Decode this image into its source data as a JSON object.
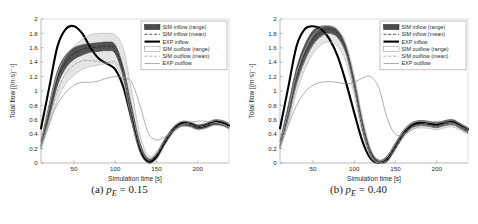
{
  "figure": {
    "panels": [
      {
        "caption_tag": "(a)",
        "caption_var": "p",
        "caption_sub": "E",
        "caption_eq": "= 0.15",
        "caption_full": "(a) p_E = 0.15"
      },
      {
        "caption_tag": "(b)",
        "caption_var": "p",
        "caption_sub": "E",
        "caption_eq": "= 0.40",
        "caption_full": "(b) p_E = 0.40"
      }
    ]
  },
  "chart_data": [
    {
      "type": "line",
      "title": "",
      "xlabel": "Simulation time [s]",
      "ylabel": "Total flow [(m·s)⁻¹]",
      "xlim": [
        10,
        238
      ],
      "ylim": [
        0,
        2
      ],
      "xticks": [
        50,
        100,
        150,
        200
      ],
      "yticks": [
        0,
        0.2,
        0.4,
        0.6,
        0.8,
        1,
        1.2,
        1.4,
        1.6,
        1.8,
        2
      ],
      "ytick_labels": [
        "0",
        "0.2",
        "0.4",
        "0.6",
        "0.8",
        "1",
        "1.2",
        "1.4",
        "1.6",
        "1.8",
        "2"
      ],
      "grid": false,
      "legend_position": "top-right",
      "legend": [
        {
          "label": "SIM inflow (range)",
          "style": "band-dark",
          "color": "#3a3a3a"
        },
        {
          "label": "SIM inflow (mean)",
          "style": "dashed-dark",
          "color": "#2b2b2b"
        },
        {
          "label": "EXP inflow",
          "style": "solid-thick",
          "color": "#000000"
        },
        {
          "label": "SIM outflow (range)",
          "style": "band-light",
          "color": "#b5b5b5"
        },
        {
          "label": "SIM outflow (mean)",
          "style": "dashed-light",
          "color": "#9a9a9a"
        },
        {
          "label": "EXP outflow",
          "style": "solid-thin",
          "color": "#8c8c8c"
        }
      ],
      "x": [
        10,
        20,
        30,
        40,
        50,
        60,
        70,
        80,
        90,
        100,
        110,
        120,
        130,
        140,
        150,
        160,
        170,
        180,
        190,
        200,
        210,
        220,
        230,
        238
      ],
      "series": [
        {
          "name": "EXP inflow",
          "style": "solid-thick",
          "color": "#000000",
          "values": [
            0.48,
            1.05,
            1.62,
            1.86,
            1.9,
            1.8,
            1.6,
            1.45,
            1.38,
            1.3,
            1.05,
            0.6,
            0.18,
            0.02,
            0.08,
            0.28,
            0.45,
            0.55,
            0.55,
            0.5,
            0.52,
            0.57,
            0.56,
            0.52
          ]
        },
        {
          "name": "SIM inflow (mean)",
          "style": "dashed-dark",
          "color": "#2b2b2b",
          "values": [
            0.24,
            0.72,
            1.18,
            1.4,
            1.52,
            1.58,
            1.6,
            1.61,
            1.62,
            1.58,
            1.25,
            0.7,
            0.22,
            0.03,
            0.1,
            0.3,
            0.46,
            0.54,
            0.54,
            0.5,
            0.52,
            0.56,
            0.55,
            0.51
          ]
        },
        {
          "name": "SIM inflow (range) upper",
          "style": "band-edge-dark",
          "color": "#4a4a4a",
          "values": [
            0.3,
            0.82,
            1.28,
            1.5,
            1.6,
            1.64,
            1.66,
            1.67,
            1.68,
            1.64,
            1.32,
            0.78,
            0.28,
            0.06,
            0.13,
            0.33,
            0.49,
            0.57,
            0.57,
            0.53,
            0.55,
            0.6,
            0.59,
            0.55
          ]
        },
        {
          "name": "SIM inflow (range) lower",
          "style": "band-edge-dark",
          "color": "#4a4a4a",
          "values": [
            0.2,
            0.64,
            1.08,
            1.32,
            1.44,
            1.5,
            1.54,
            1.55,
            1.56,
            1.52,
            1.18,
            0.62,
            0.16,
            0.0,
            0.06,
            0.26,
            0.43,
            0.51,
            0.51,
            0.47,
            0.49,
            0.53,
            0.52,
            0.48
          ]
        },
        {
          "name": "EXP outflow",
          "style": "solid-thin",
          "color": "#8c8c8c",
          "values": [
            0.22,
            0.55,
            0.82,
            0.98,
            1.08,
            1.12,
            1.12,
            1.14,
            1.18,
            1.2,
            1.18,
            1.12,
            0.8,
            0.42,
            0.32,
            0.36,
            0.44,
            0.52,
            0.56,
            0.58,
            0.58,
            0.57,
            0.54,
            0.5
          ]
        },
        {
          "name": "SIM outflow (mean)",
          "style": "dashed-light",
          "color": "#9a9a9a",
          "values": [
            0.22,
            0.6,
            1.0,
            1.24,
            1.36,
            1.42,
            1.42,
            1.41,
            1.4,
            1.4,
            1.22,
            0.72,
            0.24,
            0.04,
            0.12,
            0.3,
            0.45,
            0.53,
            0.54,
            0.5,
            0.52,
            0.56,
            0.54,
            0.5
          ]
        },
        {
          "name": "SIM outflow (range) upper",
          "style": "band-edge-light",
          "color": "#b5b5b5",
          "values": [
            0.26,
            0.78,
            1.24,
            1.48,
            1.62,
            1.72,
            1.78,
            1.8,
            1.8,
            1.78,
            1.58,
            1.0,
            0.4,
            0.1,
            0.16,
            0.34,
            0.5,
            0.58,
            0.58,
            0.54,
            0.56,
            0.6,
            0.58,
            0.54
          ]
        },
        {
          "name": "SIM outflow (range) lower",
          "style": "band-edge-light",
          "color": "#b5b5b5",
          "values": [
            0.2,
            0.52,
            0.88,
            1.1,
            1.22,
            1.3,
            1.34,
            1.36,
            1.38,
            1.36,
            1.12,
            0.58,
            0.14,
            0.0,
            0.05,
            0.24,
            0.41,
            0.5,
            0.5,
            0.46,
            0.48,
            0.52,
            0.51,
            0.47
          ]
        }
      ]
    },
    {
      "type": "line",
      "title": "",
      "xlabel": "Simulation time [s]",
      "ylabel": "Total flow [(m·s)⁻¹]",
      "xlim": [
        10,
        238
      ],
      "ylim": [
        0,
        2
      ],
      "xticks": [
        50,
        100,
        150,
        200
      ],
      "yticks": [
        0,
        0.2,
        0.4,
        0.6,
        0.8,
        1,
        1.2,
        1.4,
        1.6,
        1.8,
        2
      ],
      "ytick_labels": [
        "0",
        "0.2",
        "0.4",
        "0.6",
        "0.8",
        "1",
        "1.2",
        "1.4",
        "1.6",
        "1.8",
        "2"
      ],
      "grid": false,
      "legend_position": "top-right",
      "legend": [
        {
          "label": "SIM inflow (range)",
          "style": "band-dark",
          "color": "#3a3a3a"
        },
        {
          "label": "SIM inflow (mean)",
          "style": "dashed-dark",
          "color": "#2b2b2b"
        },
        {
          "label": "EXP inflow",
          "style": "solid-thick",
          "color": "#000000"
        },
        {
          "label": "SIM outflow (range)",
          "style": "band-light",
          "color": "#b5b5b5"
        },
        {
          "label": "SIM outflow (mean)",
          "style": "dashed-light",
          "color": "#9a9a9a"
        },
        {
          "label": "EXP outflow",
          "style": "solid-thin",
          "color": "#8c8c8c"
        }
      ],
      "x": [
        10,
        20,
        30,
        40,
        50,
        60,
        70,
        80,
        90,
        100,
        110,
        120,
        130,
        140,
        150,
        160,
        170,
        180,
        190,
        200,
        210,
        220,
        230,
        238
      ],
      "series": [
        {
          "name": "EXP inflow",
          "style": "solid-thick",
          "color": "#000000",
          "values": [
            0.48,
            1.05,
            1.62,
            1.86,
            1.9,
            1.86,
            1.72,
            1.48,
            1.12,
            0.7,
            0.3,
            0.06,
            0.0,
            0.05,
            0.22,
            0.4,
            0.52,
            0.56,
            0.55,
            0.54,
            0.57,
            0.58,
            0.52,
            0.47
          ]
        },
        {
          "name": "SIM inflow (mean)",
          "style": "dashed-dark",
          "color": "#2b2b2b",
          "values": [
            0.24,
            0.7,
            1.2,
            1.52,
            1.72,
            1.82,
            1.86,
            1.8,
            1.58,
            1.1,
            0.52,
            0.14,
            0.01,
            0.06,
            0.24,
            0.42,
            0.52,
            0.55,
            0.54,
            0.52,
            0.55,
            0.56,
            0.5,
            0.45
          ]
        },
        {
          "name": "SIM inflow (range) upper",
          "style": "band-edge-dark",
          "color": "#4a4a4a",
          "values": [
            0.3,
            0.8,
            1.32,
            1.64,
            1.84,
            1.9,
            1.9,
            1.84,
            1.62,
            1.16,
            0.58,
            0.18,
            0.04,
            0.1,
            0.28,
            0.46,
            0.56,
            0.59,
            0.58,
            0.56,
            0.59,
            0.6,
            0.54,
            0.49
          ]
        },
        {
          "name": "SIM inflow (range) lower",
          "style": "band-edge-dark",
          "color": "#4a4a4a",
          "values": [
            0.2,
            0.62,
            1.1,
            1.42,
            1.64,
            1.76,
            1.8,
            1.74,
            1.52,
            1.04,
            0.46,
            0.1,
            0.0,
            0.02,
            0.2,
            0.38,
            0.49,
            0.52,
            0.51,
            0.49,
            0.52,
            0.53,
            0.47,
            0.42
          ]
        },
        {
          "name": "EXP outflow",
          "style": "solid-thin",
          "color": "#8c8c8c",
          "values": [
            0.22,
            0.52,
            0.8,
            0.98,
            1.08,
            1.12,
            1.13,
            1.12,
            1.1,
            1.12,
            1.18,
            1.2,
            1.04,
            0.62,
            0.4,
            0.4,
            0.46,
            0.52,
            0.56,
            0.58,
            0.57,
            0.55,
            0.5,
            0.46
          ]
        },
        {
          "name": "SIM outflow (mean)",
          "style": "dashed-light",
          "color": "#9a9a9a",
          "values": [
            0.22,
            0.62,
            1.08,
            1.42,
            1.64,
            1.76,
            1.8,
            1.74,
            1.52,
            1.06,
            0.5,
            0.12,
            0.0,
            0.05,
            0.22,
            0.4,
            0.5,
            0.53,
            0.52,
            0.5,
            0.53,
            0.54,
            0.48,
            0.43
          ]
        },
        {
          "name": "SIM outflow (range) upper",
          "style": "band-edge-light",
          "color": "#b5b5b5",
          "values": [
            0.26,
            0.72,
            1.24,
            1.56,
            1.78,
            1.88,
            1.91,
            1.86,
            1.66,
            1.22,
            0.64,
            0.2,
            0.03,
            0.09,
            0.27,
            0.45,
            0.55,
            0.58,
            0.57,
            0.55,
            0.58,
            0.59,
            0.53,
            0.48
          ]
        },
        {
          "name": "SIM outflow (range) lower",
          "style": "band-edge-light",
          "color": "#b5b5b5",
          "values": [
            0.2,
            0.54,
            0.98,
            1.3,
            1.52,
            1.64,
            1.68,
            1.62,
            1.4,
            0.94,
            0.4,
            0.08,
            0.0,
            0.02,
            0.18,
            0.36,
            0.46,
            0.49,
            0.48,
            0.46,
            0.49,
            0.5,
            0.44,
            0.4
          ]
        }
      ]
    }
  ]
}
